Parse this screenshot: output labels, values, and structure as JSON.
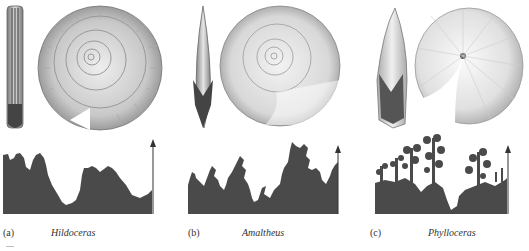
{
  "figure": {
    "fill_color": "#4a4a4a",
    "shell_shade": "#9a9a9a",
    "panels": [
      {
        "letter": "(a)",
        "genus": "Hildoceras",
        "suture_complexity": "simple lobes (ammonitic, low)"
      },
      {
        "letter": "(b)",
        "genus": "Amaltheus",
        "suture_complexity": "branched lobes (ammonitic, medium)"
      },
      {
        "letter": "(c)",
        "genus": "Phylloceras",
        "suture_complexity": "leaf-like lobes (ammonitic, high)"
      }
    ]
  }
}
